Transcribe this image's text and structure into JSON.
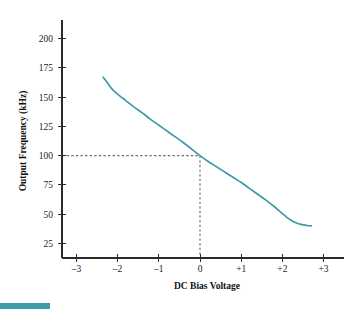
{
  "figure": {
    "background": "#ffffff",
    "curve_color": "#3f9aa8",
    "axis_color": "#2b2b2b",
    "guide_color": "#6e6e6e",
    "corner_bar_color": "#3f9aa8"
  },
  "chart_data": {
    "type": "line",
    "title": "",
    "xlabel": "DC Bias Voltage",
    "ylabel": "Output Frequency (kHz)",
    "xlim": [
      -3.35,
      3.35
    ],
    "ylim": [
      12.5,
      212.5
    ],
    "grid": false,
    "legend": null,
    "xticks": [
      -3,
      -2,
      -1,
      0,
      1,
      2,
      3
    ],
    "xticklabels": [
      "–3",
      "–2",
      "–1",
      "0",
      "+1",
      "+2",
      "+3"
    ],
    "yticks": [
      25,
      50,
      75,
      100,
      125,
      150,
      175,
      200
    ],
    "yticklabels": [
      "25",
      "50",
      "75",
      "100",
      "125",
      "150",
      "175",
      "200"
    ],
    "series": [
      {
        "name": "VCO transfer curve",
        "color": "#3f9aa8",
        "x": [
          -2.35,
          -2.25,
          -2.15,
          -2.05,
          -1.95,
          -1.8,
          -1.6,
          -1.4,
          -1.2,
          -1.0,
          -0.8,
          -0.6,
          -0.4,
          -0.2,
          0.0,
          0.2,
          0.4,
          0.6,
          0.8,
          1.0,
          1.2,
          1.4,
          1.6,
          1.8,
          2.0,
          2.1,
          2.2,
          2.3,
          2.45,
          2.6,
          2.7
        ],
        "y": [
          167.0,
          162.5,
          157.5,
          154.0,
          151.0,
          147.0,
          141.5,
          136.5,
          131.0,
          126.0,
          121.0,
          116.0,
          111.0,
          105.5,
          100.0,
          95.0,
          90.5,
          86.0,
          81.5,
          77.0,
          72.0,
          67.0,
          62.0,
          56.5,
          50.5,
          47.5,
          45.0,
          43.0,
          41.2,
          40.3,
          40.0
        ]
      }
    ],
    "annotations": [
      {
        "name": "bias-point-guide",
        "type": "dashed-crosshair",
        "x": 0,
        "y": 100,
        "color": "#6e6e6e",
        "description": "Dashed lines marking 100 kHz output at 0 V DC bias"
      }
    ]
  }
}
